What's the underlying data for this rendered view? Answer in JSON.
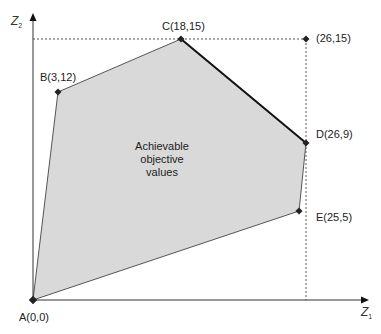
{
  "diagram": {
    "type": "objective-space-polygon",
    "axes": {
      "x": {
        "label": "Z",
        "subscript": "1"
      },
      "y": {
        "label": "Z",
        "subscript": "2"
      }
    },
    "region_label": [
      "Achievable",
      "objective",
      "values"
    ],
    "points": [
      {
        "id": "A",
        "label": "A(0,0)",
        "z1": 0,
        "z2": 0
      },
      {
        "id": "B",
        "label": "B(3,12)",
        "z1": 3,
        "z2": 12
      },
      {
        "id": "C",
        "label": "C(18,15)",
        "z1": 18,
        "z2": 15
      },
      {
        "id": "D",
        "label": "D(26,9)",
        "z1": 26,
        "z2": 9
      },
      {
        "id": "E",
        "label": "E(25,5)",
        "z1": 25,
        "z2": 5
      },
      {
        "id": "U",
        "label": "(26,15)",
        "z1": 26,
        "z2": 15
      }
    ],
    "polygon_order": [
      "A",
      "B",
      "C",
      "D",
      "E"
    ],
    "pareto_front_edge": [
      "C",
      "D"
    ],
    "dashed_guides": [
      {
        "from": "(0,15)",
        "to": "(26,15)"
      },
      {
        "from": "(26,15)",
        "to": "(26,0)"
      }
    ],
    "colors": {
      "fill": "#d9d9d9",
      "edge": "#444444",
      "pareto_edge": "#111111",
      "axis": "#333333",
      "guide": "#555555"
    }
  }
}
